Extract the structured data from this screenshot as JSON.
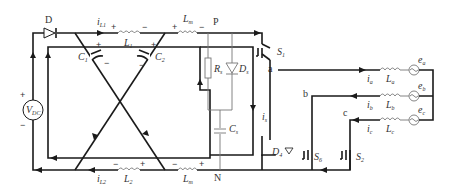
{
  "diagram": {
    "type": "circuit-schematic",
    "labels": {
      "diode_D": "D",
      "i_L1": "i",
      "i_L1_sub": "L1",
      "L1": "L",
      "L1_sub": "1",
      "Lm_top": "L",
      "Lm_top_sub": "m",
      "P": "P",
      "S1": "S",
      "S1_sub": "1",
      "a": "a",
      "b": "b",
      "c": "c",
      "C1": "C",
      "C1_sub": "1",
      "C2": "C",
      "C2_sub": "2",
      "Rs": "R",
      "Rs_sub": "s",
      "Ds": "D",
      "Ds_sub": "s",
      "Cs": "C",
      "Cs_sub": "s",
      "is": "i",
      "is_sub": "s",
      "VDC": "V",
      "VDC_sub": "DC",
      "D4": "D",
      "D4_sub": "4",
      "S6": "S",
      "S6_sub": "6",
      "S2": "S",
      "S2_sub": "2",
      "N": "N",
      "Lm_bot": "L",
      "Lm_bot_sub": "m",
      "L2": "L",
      "L2_sub": "2",
      "i_L2": "i",
      "i_L2_sub": "L2",
      "ia": "i",
      "ia_sub": "a",
      "ib": "i",
      "ib_sub": "b",
      "ic": "i",
      "ic_sub": "c",
      "La": "L",
      "La_sub": "a",
      "Lb": "L",
      "Lb_sub": "b",
      "Lc": "L",
      "Lc_sub": "c",
      "ea": "e",
      "ea_sub": "a",
      "eb": "e",
      "eb_sub": "b",
      "ec": "e",
      "ec_sub": "c",
      "plus": "+",
      "minus": "−"
    }
  }
}
